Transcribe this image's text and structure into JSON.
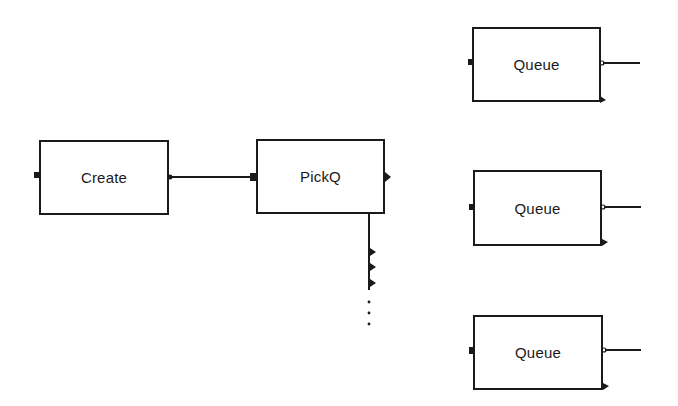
{
  "diagram": {
    "type": "block-diagram",
    "style": {
      "stroke_color": "#1a1a1a",
      "background_color": "#ffffff"
    },
    "blocks": [
      {
        "id": "create",
        "label": "Create"
      },
      {
        "id": "pickq",
        "label": "PickQ"
      },
      {
        "id": "queue1",
        "label": "Queue"
      },
      {
        "id": "queue2",
        "label": "Queue"
      },
      {
        "id": "queue3",
        "label": "Queue"
      }
    ],
    "connections": [
      {
        "from": "create.output",
        "to": "pickq.input"
      }
    ],
    "pickq_extra_outputs": {
      "visible_count": 3,
      "continuation": "vertical-ellipsis"
    },
    "queue_ports": {
      "input": "left-port",
      "output": "right-line",
      "secondary_output": "bottom-right-triangle"
    }
  }
}
